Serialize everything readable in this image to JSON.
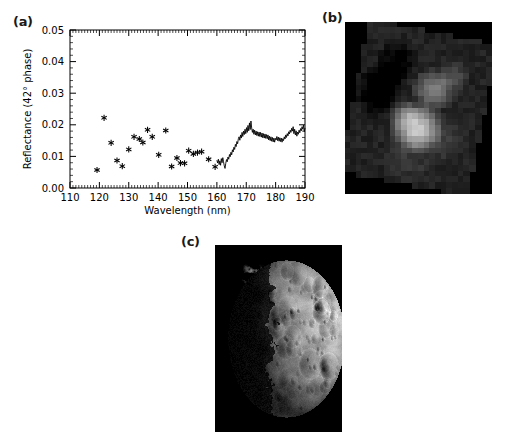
{
  "figure": {
    "panel_a_label": "(a)",
    "panel_b_label": "(b)",
    "panel_c_label": "(c)",
    "caption": ""
  },
  "chart_data": {
    "type": "scatter",
    "title": "",
    "xlabel": "Wavelength (nm)",
    "ylabel": "Reflectance (42° phase)",
    "xlim": [
      110,
      190
    ],
    "ylim": [
      0.0,
      0.05
    ],
    "xticks": [
      110,
      120,
      130,
      140,
      150,
      160,
      170,
      180,
      190
    ],
    "xticklabels": [
      "110",
      "120",
      "130",
      "140",
      "150",
      "160",
      "170",
      "180",
      "190"
    ],
    "yticks": [
      0.0,
      0.01,
      0.02,
      0.03,
      0.04,
      0.05
    ],
    "yticklabels": [
      "0.00",
      "0.01",
      "0.02",
      "0.03",
      "0.04",
      "0.05"
    ],
    "x_minor_per_major": 10,
    "y_minor_per_major": 5,
    "grid": false,
    "legend": "none",
    "frame": true,
    "ticks_inward": true,
    "series": [
      {
        "name": "FUV band reflectance points",
        "type": "scatter",
        "marker": "asterisk",
        "color": "#000000",
        "points": [
          [
            119.2,
            0.0057
          ],
          [
            121.6,
            0.0222
          ],
          [
            124.0,
            0.0143
          ],
          [
            126.0,
            0.0087
          ],
          [
            127.8,
            0.0069
          ],
          [
            130.0,
            0.0122
          ],
          [
            131.8,
            0.0162
          ],
          [
            133.6,
            0.0155
          ],
          [
            134.8,
            0.0144
          ],
          [
            136.4,
            0.0184
          ],
          [
            138.0,
            0.0162
          ],
          [
            140.2,
            0.0105
          ],
          [
            142.6,
            0.0182
          ],
          [
            144.6,
            0.0068
          ],
          [
            146.4,
            0.0095
          ],
          [
            147.6,
            0.0079
          ],
          [
            149.0,
            0.0078
          ],
          [
            150.4,
            0.0118
          ],
          [
            152.0,
            0.0108
          ],
          [
            153.4,
            0.0112
          ],
          [
            154.8,
            0.0115
          ],
          [
            157.2,
            0.0091
          ],
          [
            159.4,
            0.0067
          ]
        ]
      },
      {
        "name": "FUV spectrum trace",
        "type": "line",
        "color": "#000000",
        "x_start": 160.0,
        "x_end": 190.0,
        "values": [
          0.0088,
          0.0079,
          0.0091,
          0.0074,
          0.0086,
          0.0072,
          0.0093,
          0.008,
          0.0096,
          0.0083,
          0.007,
          0.0062,
          0.0078,
          0.009,
          0.0083,
          0.0098,
          0.0091,
          0.0106,
          0.0099,
          0.0113,
          0.0105,
          0.0121,
          0.0114,
          0.0129,
          0.0122,
          0.0138,
          0.0131,
          0.0147,
          0.014,
          0.0156,
          0.0162,
          0.0151,
          0.0168,
          0.0158,
          0.0176,
          0.0163,
          0.018,
          0.0169,
          0.0186,
          0.0172,
          0.0191,
          0.0176,
          0.0198,
          0.0181,
          0.0206,
          0.0185,
          0.0212,
          0.019,
          0.0176,
          0.0186,
          0.017,
          0.0183,
          0.0168,
          0.018,
          0.0166,
          0.0178,
          0.0164,
          0.0177,
          0.0163,
          0.0176,
          0.0161,
          0.0174,
          0.0159,
          0.0172,
          0.0158,
          0.0171,
          0.0157,
          0.0169,
          0.0156,
          0.0168,
          0.0152,
          0.0164,
          0.015,
          0.0162,
          0.0148,
          0.016,
          0.0146,
          0.0158,
          0.0145,
          0.0157,
          0.0152,
          0.0163,
          0.015,
          0.0161,
          0.0148,
          0.0159,
          0.0147,
          0.0158,
          0.0145,
          0.0156,
          0.015,
          0.0162,
          0.0155,
          0.0168,
          0.016,
          0.0172,
          0.0165,
          0.0178,
          0.0171,
          0.0183,
          0.0176,
          0.0189,
          0.018,
          0.0194,
          0.0172,
          0.0186,
          0.0168,
          0.0181,
          0.0164,
          0.0177,
          0.017,
          0.0183,
          0.0175,
          0.0188,
          0.0181,
          0.0194,
          0.0186,
          0.0199,
          0.0178,
          0.019
        ]
      }
    ]
  },
  "panel_b_image": {
    "name": "uv-mosaic",
    "background": "#000000",
    "description": "low-resolution grayscale ultraviolet mosaic",
    "grid_cols": 26,
    "grid_rows": 30
  },
  "panel_c_image": {
    "name": "moon-surface",
    "background": "#000000",
    "description": "cratered moon disc, sunlit from the right"
  }
}
